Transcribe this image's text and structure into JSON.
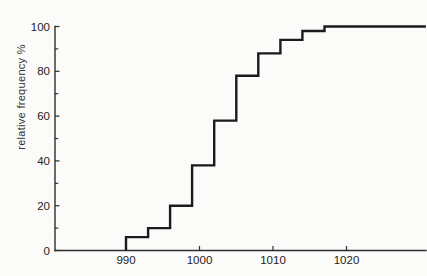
{
  "figure": {
    "background_color": "#fbfbf9",
    "curve_color": "#1b1b1b",
    "axis_color": "#2e2e2e",
    "text_color": "#232323"
  },
  "chart_data": {
    "type": "step",
    "title": "",
    "xlabel": "",
    "ylabel": "relative frequency %",
    "grid": false,
    "legend": false,
    "ylim": [
      0,
      100
    ],
    "x_axis_range": [
      980.3,
      1030.8
    ],
    "x_tick_labels": [
      990,
      1000,
      1010,
      1020
    ],
    "y_tick_labels": [
      0,
      20,
      40,
      60,
      80,
      100
    ],
    "y_minor_ticks": [
      10,
      30,
      50,
      70,
      90
    ],
    "series": [
      {
        "name": "cumulative relative frequency",
        "starts_at_percent": 0,
        "class_boundaries": [
          990,
          993,
          996,
          999,
          1002,
          1005,
          1008,
          1011,
          1014,
          1017
        ],
        "cumulative_percent": [
          6,
          10,
          20,
          38,
          58,
          78,
          88,
          94,
          98,
          100
        ],
        "extends_to_x": 1030.8
      }
    ]
  }
}
